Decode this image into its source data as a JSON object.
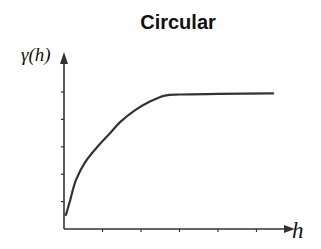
{
  "chart_data": {
    "type": "line",
    "title": "Circular",
    "xlabel": "h",
    "ylabel": "γ(h)",
    "x_ticks": 5,
    "y_ticks": 5,
    "tick_labels_shown": false,
    "grid": false,
    "legend": null,
    "xlim": [
      0,
      6
    ],
    "ylim": [
      0,
      6
    ],
    "series": [
      {
        "name": "Circular variogram model",
        "x": [
          0.05,
          0.16,
          0.31,
          0.55,
          0.88,
          1.19,
          1.45,
          1.84,
          2.23,
          2.62,
          3.01,
          4.0,
          5.43
        ],
        "y": [
          0.51,
          1.05,
          1.78,
          2.44,
          3.02,
          3.49,
          3.89,
          4.33,
          4.65,
          4.87,
          4.91,
          4.93,
          4.95
        ]
      }
    ],
    "model_params": {
      "nugget": 0.5,
      "sill": 4.95,
      "range": 2.6
    },
    "colors": {
      "line": "#333333",
      "axes": "#333333",
      "text": "#111111"
    }
  }
}
